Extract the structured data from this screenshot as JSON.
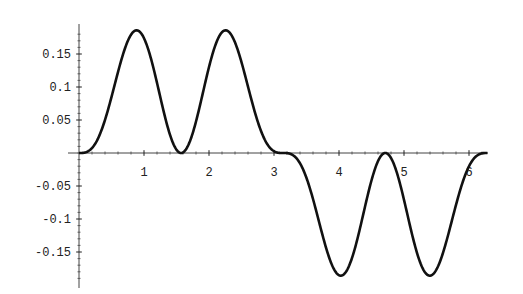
{
  "chart_data": {
    "type": "line",
    "title": "",
    "xlabel": "",
    "ylabel": "",
    "function_approx": "sin(x)^3 * cos(x)^2",
    "xlim": [
      0,
      6.283
    ],
    "ylim": [
      -0.19,
      0.19
    ],
    "grid": false,
    "legend": null,
    "x_ticks": [
      "1",
      "2",
      "3",
      "4",
      "5",
      "6"
    ],
    "y_ticks": [
      "0.15",
      "0.1",
      "0.05",
      "-0.05",
      "-0.1",
      "-0.15"
    ],
    "y_tick_values": [
      0.15,
      0.1,
      0.05,
      -0.05,
      -0.1,
      -0.15
    ],
    "key_points": [
      {
        "x": 0,
        "y": 0
      },
      {
        "x": 0.886,
        "y": 0.186
      },
      {
        "x": 1.571,
        "y": 0
      },
      {
        "x": 2.256,
        "y": 0.186
      },
      {
        "x": 3.142,
        "y": 0
      },
      {
        "x": 4.027,
        "y": -0.186
      },
      {
        "x": 4.712,
        "y": 0
      },
      {
        "x": 5.398,
        "y": -0.186
      },
      {
        "x": 6.283,
        "y": 0
      }
    ],
    "series": [
      {
        "name": "f(x)",
        "color": "#111111"
      }
    ]
  },
  "layout": {
    "origin_px": [
      79,
      153
    ],
    "px_per_x": 65,
    "px_per_y": 660
  }
}
